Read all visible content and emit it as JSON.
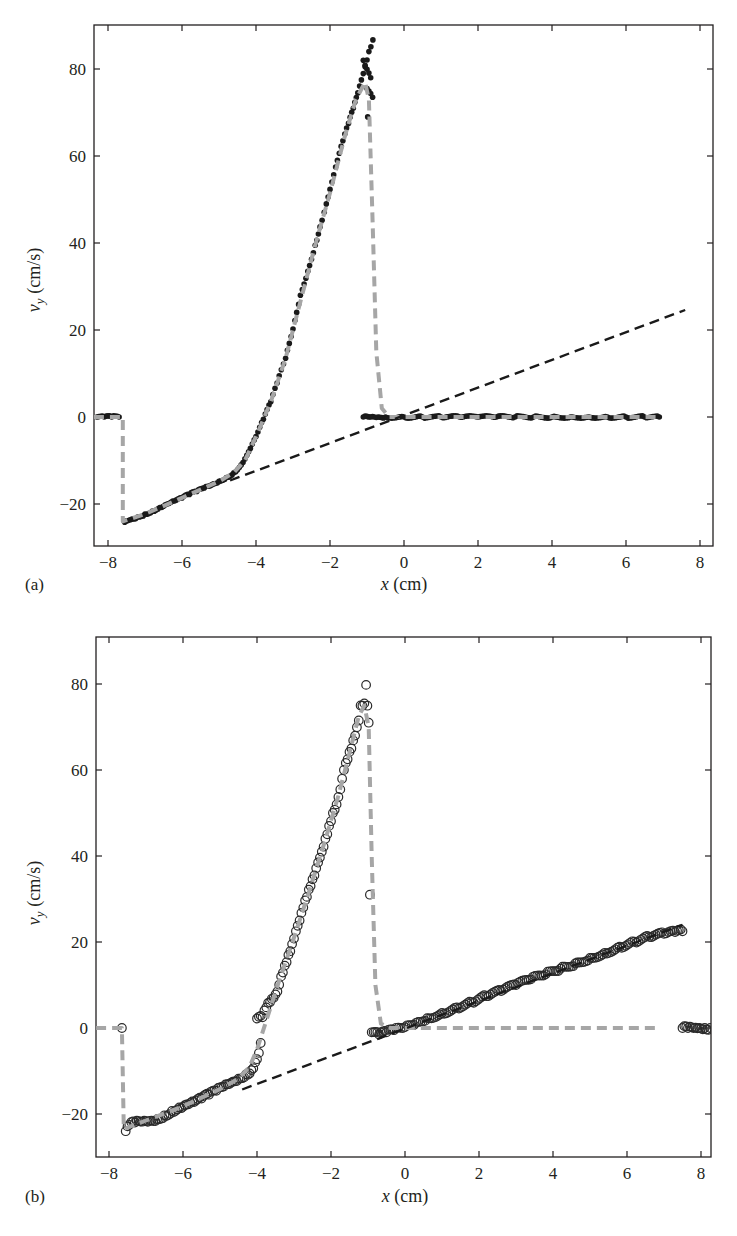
{
  "chart_data": [
    {
      "type": "scatter",
      "panel_label": "(a)",
      "title": "",
      "xlabel": "x (cm)",
      "ylabel": "v_y (cm/s)",
      "ylabel_main": "v",
      "ylabel_sub": "y",
      "ylabel_unit": " (cm/s)",
      "xlabel_var": "x",
      "xlabel_unit": " (cm)",
      "xlim": [
        -8.38,
        8.35
      ],
      "ylim": [
        -29.7,
        90
      ],
      "xticks": [
        -8,
        -6,
        -4,
        -2,
        0,
        2,
        4,
        6,
        8
      ],
      "yticks": [
        -20,
        0,
        20,
        40,
        60,
        80
      ],
      "grid": false,
      "legend": null,
      "marker": "filled-dot",
      "series": [
        {
          "name": "measured data (filled dots)",
          "color": "#1a1a1a",
          "points": [
            [
              -8.3,
              0
            ],
            [
              -8.1,
              0
            ],
            [
              -7.9,
              0
            ],
            [
              -7.7,
              0
            ],
            [
              -7.55,
              -24.2
            ],
            [
              -7.4,
              -23.6
            ],
            [
              -7.2,
              -23.0
            ],
            [
              -7.0,
              -22.3
            ],
            [
              -6.8,
              -21.6
            ],
            [
              -6.6,
              -20.8
            ],
            [
              -6.4,
              -20.0
            ],
            [
              -6.2,
              -19.3
            ],
            [
              -6.0,
              -18.6
            ],
            [
              -5.8,
              -17.8
            ],
            [
              -5.6,
              -17.1
            ],
            [
              -5.4,
              -16.3
            ],
            [
              -5.2,
              -15.6
            ],
            [
              -5.0,
              -14.8
            ],
            [
              -4.8,
              -13.9
            ],
            [
              -4.6,
              -12.8
            ],
            [
              -4.4,
              -11.0
            ],
            [
              -4.2,
              -8.0
            ],
            [
              -4.0,
              -4.5
            ],
            [
              -3.8,
              -0.5
            ],
            [
              -3.6,
              3.5
            ],
            [
              -3.43,
              7.8
            ],
            [
              -3.2,
              13.5
            ],
            [
              -3.0,
              20.2
            ],
            [
              -2.8,
              28.0
            ],
            [
              -2.6,
              33.5
            ],
            [
              -2.4,
              39.5
            ],
            [
              -2.27,
              43.7
            ],
            [
              -2.1,
              49.0
            ],
            [
              -1.95,
              54.0
            ],
            [
              -1.8,
              59.0
            ],
            [
              -1.65,
              63.5
            ],
            [
              -1.5,
              67.5
            ],
            [
              -1.37,
              71.0
            ],
            [
              -1.25,
              74.5
            ],
            [
              -1.15,
              77.5
            ],
            [
              -1.05,
              80.5
            ],
            [
              -0.95,
              84.0
            ],
            [
              -0.84,
              86.7
            ],
            [
              -1.1,
              82.0
            ],
            [
              -0.9,
              78.0
            ],
            [
              -1.0,
              75.5
            ],
            [
              -0.85,
              73.5
            ],
            [
              -0.98,
              69.0
            ],
            [
              -1.1,
              0
            ],
            [
              -0.9,
              0
            ],
            [
              -0.7,
              0
            ],
            [
              -0.5,
              0
            ],
            [
              0,
              0
            ],
            [
              0.5,
              0
            ],
            [
              1,
              0
            ],
            [
              1.5,
              0
            ],
            [
              2,
              0
            ],
            [
              2.5,
              0
            ],
            [
              3,
              0
            ],
            [
              3.5,
              0
            ],
            [
              4,
              0
            ],
            [
              4.5,
              0
            ],
            [
              5,
              0
            ],
            [
              5.5,
              0
            ],
            [
              6,
              0
            ],
            [
              6.5,
              0
            ],
            [
              6.9,
              0
            ]
          ]
        },
        {
          "name": "model fit (gray dashed)",
          "color": "#a6a6a6",
          "style": "dashed",
          "points": [
            [
              -8.38,
              0
            ],
            [
              -7.6,
              0
            ],
            [
              -7.6,
              -24
            ],
            [
              -7.0,
              -22.3
            ],
            [
              -6.0,
              -18.6
            ],
            [
              -5.0,
              -14.8
            ],
            [
              -4.6,
              -12.8
            ],
            [
              -4.3,
              -10.0
            ],
            [
              -4.0,
              -4.5
            ],
            [
              -3.6,
              3.5
            ],
            [
              -3.2,
              13.5
            ],
            [
              -2.8,
              26.5
            ],
            [
              -2.4,
              39.5
            ],
            [
              -2.0,
              51.5
            ],
            [
              -1.6,
              64.5
            ],
            [
              -1.3,
              73.0
            ],
            [
              -1.05,
              77.0
            ],
            [
              -0.95,
              73.0
            ],
            [
              -0.85,
              45.0
            ],
            [
              -0.75,
              15.0
            ],
            [
              -0.6,
              2.0
            ],
            [
              -0.4,
              0
            ],
            [
              6.9,
              0
            ]
          ]
        },
        {
          "name": "linear reference (black dashed)",
          "color": "#1a1a1a",
          "style": "dashed",
          "points": [
            [
              -4.7,
              -14.6
            ],
            [
              7.6,
              24.6
            ]
          ]
        }
      ]
    },
    {
      "type": "scatter",
      "panel_label": "(b)",
      "title": "",
      "xlabel": "x (cm)",
      "ylabel": "v_y (cm/s)",
      "ylabel_main": "v",
      "ylabel_sub": "y",
      "ylabel_unit": " (cm/s)",
      "xlabel_var": "x",
      "xlabel_unit": " (cm)",
      "xlim": [
        -8.35,
        8.27
      ],
      "ylim": [
        -30,
        91
      ],
      "xticks": [
        -8,
        -6,
        -4,
        -2,
        0,
        2,
        4,
        6,
        8
      ],
      "yticks": [
        -20,
        0,
        20,
        40,
        60,
        80
      ],
      "grid": false,
      "legend": null,
      "marker": "open-circle",
      "series": [
        {
          "name": "measured data (open circles)",
          "color": "#1a1a1a",
          "points": [
            [
              -7.65,
              0
            ],
            [
              -7.55,
              -24.0
            ],
            [
              -7.45,
              -22.5
            ],
            [
              -7.3,
              -22.0
            ],
            [
              -7.1,
              -21.8
            ],
            [
              -6.9,
              -21.6
            ],
            [
              -6.7,
              -21.2
            ],
            [
              -6.5,
              -20.3
            ],
            [
              -6.3,
              -19.3
            ],
            [
              -6.1,
              -18.5
            ],
            [
              -5.9,
              -17.8
            ],
            [
              -5.7,
              -17.2
            ],
            [
              -5.5,
              -16.4
            ],
            [
              -5.3,
              -15.5
            ],
            [
              -5.1,
              -14.6
            ],
            [
              -4.9,
              -13.6
            ],
            [
              -4.7,
              -12.7
            ],
            [
              -4.5,
              -11.8
            ],
            [
              -4.3,
              -10.8
            ],
            [
              -4.15,
              -9.8
            ],
            [
              -4.05,
              -8.0
            ],
            [
              -3.95,
              -5.8
            ],
            [
              -3.9,
              -3.5
            ],
            [
              -4.0,
              2.2
            ],
            [
              -3.85,
              2.5
            ],
            [
              -3.75,
              4.8
            ],
            [
              -3.65,
              6.0
            ],
            [
              -3.55,
              7.0
            ],
            [
              -3.45,
              8.5
            ],
            [
              -3.35,
              12.0
            ],
            [
              -3.25,
              14.5
            ],
            [
              -3.15,
              17.0
            ],
            [
              -3.05,
              19.5
            ],
            [
              -2.95,
              22.5
            ],
            [
              -2.85,
              25.0
            ],
            [
              -2.75,
              28.0
            ],
            [
              -2.65,
              30.5
            ],
            [
              -2.55,
              33.0
            ],
            [
              -2.45,
              35.5
            ],
            [
              -2.35,
              38.5
            ],
            [
              -2.25,
              41.0
            ],
            [
              -2.15,
              44.0
            ],
            [
              -2.05,
              47.0
            ],
            [
              -1.95,
              50.0
            ],
            [
              -1.85,
              52.0
            ],
            [
              -1.75,
              55.5
            ],
            [
              -1.65,
              60.0
            ],
            [
              -1.55,
              62.5
            ],
            [
              -1.45,
              65.0
            ],
            [
              -1.35,
              68.0
            ],
            [
              -1.25,
              71.5
            ],
            [
              -1.2,
              75.0
            ],
            [
              -1.1,
              75.5
            ],
            [
              -1.05,
              79.8
            ],
            [
              -0.98,
              71.0
            ],
            [
              -0.95,
              31.0
            ],
            [
              -0.9,
              -1.0
            ],
            [
              -0.7,
              -1.5
            ],
            [
              -0.5,
              -1.0
            ],
            [
              -0.3,
              -0.5
            ],
            [
              0,
              0.2
            ],
            [
              0.3,
              1.2
            ],
            [
              0.6,
              2.3
            ],
            [
              1.0,
              3.5
            ],
            [
              1.4,
              4.8
            ],
            [
              1.8,
              6.0
            ],
            [
              2.2,
              7.4
            ],
            [
              2.6,
              8.6
            ],
            [
              3.0,
              10.0
            ],
            [
              3.4,
              11.3
            ],
            [
              3.8,
              12.5
            ],
            [
              4.2,
              13.8
            ],
            [
              4.6,
              15.0
            ],
            [
              5.0,
              16.3
            ],
            [
              5.4,
              17.5
            ],
            [
              5.8,
              18.9
            ],
            [
              6.2,
              20.1
            ],
            [
              6.6,
              21.2
            ],
            [
              7.0,
              21.9
            ],
            [
              7.3,
              22.3
            ],
            [
              7.5,
              22.5
            ],
            [
              7.5,
              0
            ],
            [
              7.65,
              0
            ],
            [
              7.8,
              0
            ],
            [
              7.95,
              0
            ],
            [
              8.1,
              0
            ],
            [
              8.25,
              0
            ]
          ]
        },
        {
          "name": "model fit (gray dashed)",
          "color": "#a6a6a6",
          "style": "dashed",
          "points": [
            [
              -8.35,
              0
            ],
            [
              -7.65,
              0
            ],
            [
              -7.6,
              -23.5
            ],
            [
              -7.0,
              -21.5
            ],
            [
              -6.0,
              -18.2
            ],
            [
              -5.0,
              -14.2
            ],
            [
              -4.5,
              -11.8
            ],
            [
              -4.2,
              -9.0
            ],
            [
              -4.0,
              -5.0
            ],
            [
              -3.7,
              3.0
            ],
            [
              -3.4,
              11.0
            ],
            [
              -3.0,
              21.0
            ],
            [
              -2.6,
              31.5
            ],
            [
              -2.2,
              42.5
            ],
            [
              -1.8,
              54.0
            ],
            [
              -1.5,
              64.0
            ],
            [
              -1.25,
              72.5
            ],
            [
              -1.1,
              75.0
            ],
            [
              -0.98,
              70.0
            ],
            [
              -0.9,
              40.0
            ],
            [
              -0.8,
              10.0
            ],
            [
              -0.65,
              1.0
            ],
            [
              -0.4,
              0
            ],
            [
              6.8,
              0
            ]
          ]
        },
        {
          "name": "linear reference (black dashed)",
          "color": "#1a1a1a",
          "style": "dashed",
          "points": [
            [
              -4.4,
              -14.3
            ],
            [
              7.5,
              24.0
            ]
          ]
        }
      ]
    }
  ]
}
